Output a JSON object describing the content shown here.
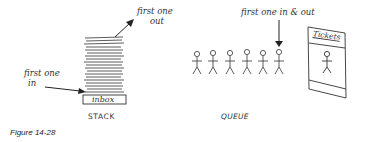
{
  "stack": {
    "label": "STACK",
    "top_annotation_line1": "first one",
    "top_annotation_line2": "out",
    "bottom_annotation_line1": "first one",
    "bottom_annotation_line2": "in",
    "tray_label": "inbox",
    "paper_sheet_count": 16
  },
  "queue": {
    "label": "QUEUE",
    "annotation": "first one in & out",
    "person_count": 6,
    "booth_label": "Tickets"
  },
  "figure": {
    "caption": "Figure 14-28"
  }
}
